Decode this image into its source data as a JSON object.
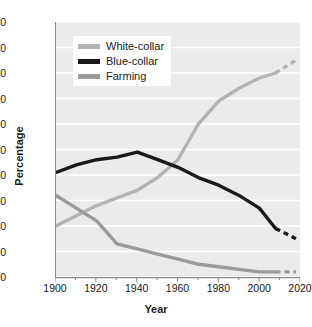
{
  "chart_data": {
    "type": "line",
    "title": "",
    "xlabel": "Year",
    "ylabel": "Percentage",
    "xlim": [
      1900,
      2020
    ],
    "ylim": [
      0,
      100
    ],
    "xticks": [
      1900,
      1920,
      1940,
      1960,
      1980,
      2000,
      2020
    ],
    "yticks": [
      0,
      10,
      20,
      30,
      40,
      50,
      60,
      70,
      80,
      90,
      100
    ],
    "xminor_step": 10,
    "grid": "horizontal-white",
    "legend_position": "upper-left-inside",
    "x": [
      1900,
      1910,
      1920,
      1930,
      1940,
      1950,
      1960,
      1970,
      1980,
      1990,
      2000,
      2008
    ],
    "series": [
      {
        "name": "White-collar",
        "color": "#b4b4b4",
        "values": [
          20,
          24,
          28,
          31,
          34,
          39,
          46,
          60,
          69,
          74,
          78,
          80
        ],
        "projection": {
          "x": [
            2008,
            2018
          ],
          "values": [
            80,
            85
          ],
          "style": "dashed"
        }
      },
      {
        "name": "Blue-collar",
        "color": "#1a1a1a",
        "values": [
          41,
          44,
          46,
          47,
          49,
          46,
          43,
          39,
          36,
          32,
          27,
          19
        ],
        "projection": {
          "x": [
            2008,
            2018
          ],
          "values": [
            19,
            15
          ],
          "style": "dashed"
        }
      },
      {
        "name": "Farming",
        "color": "#9b9b9b",
        "values": [
          32,
          27,
          22,
          13,
          11,
          9,
          7,
          5,
          4,
          3,
          2,
          2
        ],
        "projection": {
          "x": [
            2008,
            2018
          ],
          "values": [
            2,
            2
          ],
          "style": "dashed"
        }
      }
    ],
    "legend": [
      {
        "label": "White-collar",
        "color": "#b4b4b4"
      },
      {
        "label": "Blue-collar",
        "color": "#1a1a1a"
      },
      {
        "label": "Farming",
        "color": "#9b9b9b"
      }
    ],
    "colors": {
      "plot_background": "#ebebeb",
      "gridline": "#ffffff",
      "axis": "#8a8a8a",
      "text": "#1b1b1b",
      "page_background": "#ffffff"
    }
  }
}
